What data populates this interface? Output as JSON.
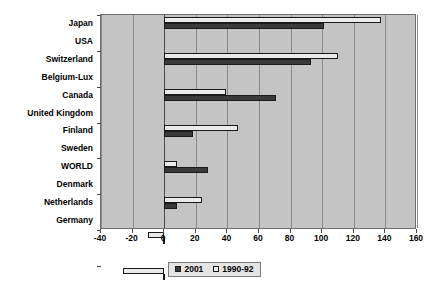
{
  "chart_data": {
    "type": "bar",
    "orientation": "horizontal",
    "title": "",
    "subtitle": "",
    "xlabel": "",
    "ylabel": "",
    "xlim": [
      -40,
      160
    ],
    "xticks": [
      -40,
      -20,
      0,
      20,
      40,
      60,
      80,
      100,
      120,
      140,
      160
    ],
    "xtick_labels": [
      "-40",
      "-20",
      "0",
      "20",
      "40",
      "60",
      "80",
      "100",
      "120",
      "140",
      "160"
    ],
    "grid": true,
    "grid_axis": "x",
    "legend_position": "bottom",
    "categories": [
      "Japan",
      "USA",
      "Switzerland",
      "Belgium-Lux",
      "Canada",
      "United Kingdom",
      "Finland",
      "Sweden",
      "WORLD",
      "Denmark",
      "Netherlands",
      "Germany"
    ],
    "series": [
      {
        "name": "2001",
        "color": "#3a3a3a",
        "values": [
          101,
          93,
          71,
          18,
          28,
          8,
          -1,
          -1,
          0,
          -4,
          -7,
          -22
        ]
      },
      {
        "name": "1990-92",
        "color": "#eaeaea",
        "values": [
          137,
          110,
          39,
          47,
          8,
          24,
          -10,
          -26,
          0,
          -7,
          3,
          -19
        ]
      }
    ]
  },
  "legend": {
    "entries": [
      {
        "label": "2001",
        "swatch": "dark-swatch"
      },
      {
        "label": "1990-92",
        "swatch": "light-swatch"
      }
    ]
  },
  "colors": {
    "plot_background": "#c4c4c4",
    "page_background": "#ffffff",
    "gridline": "#8a8a8a",
    "zero_line": "#4a4a4a",
    "axis": "#6e6e6e",
    "series_2001": "#3a3a3a",
    "series_1990_92": "#eaeaea",
    "text": "#000000"
  }
}
